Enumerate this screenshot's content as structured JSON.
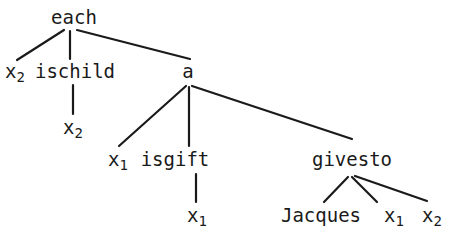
{
  "figure": {
    "name": "syntax-parse-tree",
    "background_color": "#ffffff",
    "ink_color": "#1a1a1a",
    "width": 457,
    "height": 240
  },
  "nodes": [
    {
      "id": "each",
      "label": "each",
      "sub": "",
      "x": 74,
      "y": 8,
      "depth": 0
    },
    {
      "id": "x2a",
      "label": "x",
      "sub": "2",
      "x": 15,
      "y": 62,
      "depth": 1
    },
    {
      "id": "ischild",
      "label": "ischild",
      "sub": "",
      "x": 75,
      "y": 62,
      "depth": 1
    },
    {
      "id": "a",
      "label": "a",
      "sub": "",
      "x": 188,
      "y": 62,
      "depth": 1
    },
    {
      "id": "x2b",
      "label": "x",
      "sub": "2",
      "x": 73,
      "y": 118,
      "depth": 2
    },
    {
      "id": "x1a",
      "label": "x",
      "sub": "1",
      "x": 118,
      "y": 150,
      "depth": 2
    },
    {
      "id": "isgift",
      "label": "isgift",
      "sub": "",
      "x": 175,
      "y": 150,
      "depth": 2
    },
    {
      "id": "givesto",
      "label": "givesto",
      "sub": "",
      "x": 352,
      "y": 150,
      "depth": 2
    },
    {
      "id": "x1b",
      "label": "x",
      "sub": "1",
      "x": 197,
      "y": 206,
      "depth": 3
    },
    {
      "id": "jacques",
      "label": "Jacques",
      "sub": "",
      "x": 321,
      "y": 206,
      "depth": 3
    },
    {
      "id": "x1c",
      "label": "x",
      "sub": "1",
      "x": 394,
      "y": 206,
      "depth": 3
    },
    {
      "id": "x2c",
      "label": "x",
      "sub": "2",
      "x": 432,
      "y": 206,
      "depth": 3
    }
  ],
  "edges": [
    {
      "from": "each",
      "to": "x2a",
      "x1": 64,
      "y1": 30,
      "x2": 17,
      "y2": 60
    },
    {
      "from": "each",
      "to": "ischild",
      "x1": 70,
      "y1": 31,
      "x2": 70,
      "y2": 59
    },
    {
      "from": "each",
      "to": "a",
      "x1": 77,
      "y1": 30,
      "x2": 190,
      "y2": 59
    },
    {
      "from": "ischild",
      "to": "x2b",
      "x1": 73,
      "y1": 85,
      "x2": 73,
      "y2": 114
    },
    {
      "from": "a",
      "to": "x1a",
      "x1": 186,
      "y1": 86,
      "x2": 119,
      "y2": 146
    },
    {
      "from": "a",
      "to": "isgift",
      "x1": 189,
      "y1": 87,
      "x2": 189,
      "y2": 146
    },
    {
      "from": "a",
      "to": "givesto",
      "x1": 192,
      "y1": 86,
      "x2": 352,
      "y2": 139
    },
    {
      "from": "isgift",
      "to": "x1b",
      "x1": 196,
      "y1": 174,
      "x2": 196,
      "y2": 202
    },
    {
      "from": "givesto",
      "to": "jacques",
      "x1": 348,
      "y1": 177,
      "x2": 324,
      "y2": 202
    },
    {
      "from": "givesto",
      "to": "x1c",
      "x1": 352,
      "y1": 177,
      "x2": 377,
      "y2": 202
    },
    {
      "from": "givesto",
      "to": "x2c",
      "x1": 355,
      "y1": 176,
      "x2": 427,
      "y2": 201
    }
  ]
}
